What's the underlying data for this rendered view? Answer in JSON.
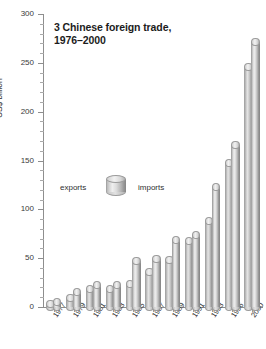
{
  "chart_data": {
    "type": "bar",
    "title": "3 Chinese foreign trade, 1976–2000",
    "title_line1": "3 Chinese foreign trade,",
    "title_line2": "1976–2000",
    "xlabel": "",
    "ylabel": "US$ billion",
    "ylim": [
      0,
      300
    ],
    "ytick_values": [
      0,
      50,
      100,
      150,
      200,
      250,
      300
    ],
    "ytick_labels": [
      "0",
      "50",
      "100",
      "150",
      "200",
      "250",
      "300"
    ],
    "ytick_step": 50,
    "yminor_step": 10,
    "grid": false,
    "legend_position": "inside-left",
    "categories": [
      "1977",
      "1979",
      "1981",
      "1983",
      "1985",
      "1987",
      "1989",
      "1991",
      "1993",
      "1996",
      "2000"
    ],
    "series": [
      {
        "name": "exports",
        "values": [
          7.6,
          13.7,
          22.0,
          22.2,
          27.4,
          39.4,
          52.5,
          71.8,
          91.8,
          151.0,
          249.2
        ]
      },
      {
        "name": "imports",
        "values": [
          7.2,
          15.7,
          22.0,
          21.4,
          42.3,
          43.2,
          59.1,
          63.8,
          104.0,
          138.8,
          225.1
        ]
      }
    ],
    "series_draw_note": "back cylinder drawn left (taller-in-front grouping); 2000 front bar peak ≈ 275",
    "bars_front_peak_2000": 275,
    "bars_back_peak_2000": 250,
    "colors": {
      "cylinder_light": "#efefef",
      "cylinder_mid": "#c8c8c8",
      "cylinder_dark": "#8e8e8e",
      "axis": "#8e8e8e",
      "text": "#2b2b2b",
      "background": "#ffffff"
    }
  },
  "legend": {
    "left_label": "exports",
    "right_label": "imports",
    "swatch_icon": "cylinder-icon"
  },
  "axis": {
    "y_title": "US$ billion"
  }
}
